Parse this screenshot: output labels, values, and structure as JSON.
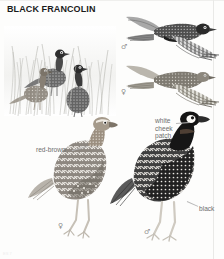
{
  "page": {
    "title": "BLACK FRANCOLIN",
    "background_color": "#fdfdfc",
    "credit": "ES 7"
  },
  "symbols": {
    "male": "♂",
    "female": "♀"
  },
  "figures": [
    {
      "id": "habitat-group",
      "name": "habitat-scene-three-birds-in-grass",
      "description": "Three black francolins standing among tall grass",
      "position": {
        "x": 6,
        "y": 20,
        "w": 108,
        "h": 98
      }
    },
    {
      "id": "flight-male",
      "name": "male-in-flight",
      "sex": "male",
      "sex_symbol": "♂",
      "position": {
        "x": 124,
        "y": 12,
        "w": 96,
        "h": 48
      }
    },
    {
      "id": "flight-female",
      "name": "female-in-flight",
      "sex": "female",
      "sex_symbol": "♀",
      "position": {
        "x": 124,
        "y": 62,
        "w": 96,
        "h": 44
      }
    },
    {
      "id": "standing-female",
      "name": "standing-female",
      "sex": "female",
      "sex_symbol": "♀",
      "position": {
        "x": 30,
        "y": 112,
        "w": 86,
        "h": 128
      }
    },
    {
      "id": "standing-male",
      "name": "standing-male",
      "sex": "male",
      "sex_symbol": "♂",
      "position": {
        "x": 112,
        "y": 108,
        "w": 98,
        "h": 132
      }
    }
  ],
  "annotations": [
    {
      "id": "red-brown",
      "text": "red-brown",
      "target": "standing-female-nape",
      "position": {
        "x": 37,
        "y": 145
      },
      "leader": {
        "x": 74,
        "y": 150,
        "w": 14,
        "angle": -18
      }
    },
    {
      "id": "white-cheek-patch",
      "text": "white\ncheek\npatch",
      "target": "standing-male-cheek",
      "position": {
        "x": 155,
        "y": 119
      },
      "leader": {
        "x": 175,
        "y": 124,
        "w": 13,
        "angle": 0
      }
    },
    {
      "id": "black",
      "text": "black",
      "target": "standing-male-breast",
      "position": {
        "x": 198,
        "y": 205
      },
      "leader": {
        "x": 186,
        "y": 203,
        "w": 12,
        "angle": -28
      }
    }
  ]
}
